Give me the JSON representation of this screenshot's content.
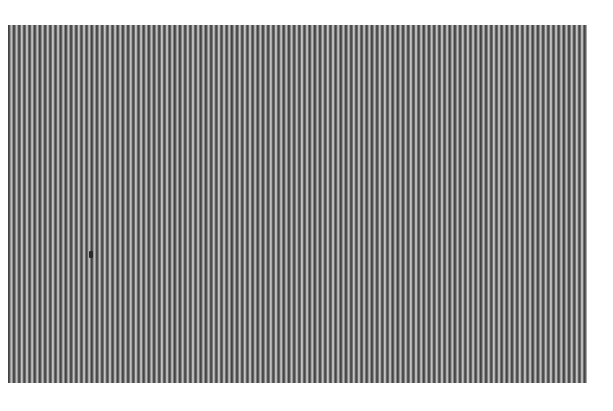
{
  "image": {
    "description": "Vertical grating / stripe pattern",
    "colors": {
      "dark_stripe": "#3a3a3a",
      "light_stripe": "#d0d0d0",
      "background": "#ffffff"
    },
    "stripe_period_px": 5.2,
    "marker": "small dark spot"
  }
}
